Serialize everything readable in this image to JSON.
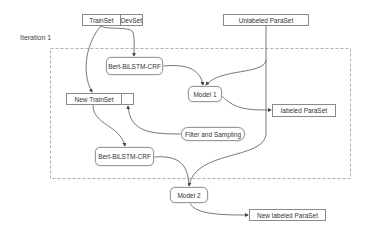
{
  "diagram": {
    "iteration_label": "Iteration 1",
    "nodes": {
      "trainset": "TrainSet",
      "devset": "DevSet",
      "unlabeled_paraset": "Unlabeled ParaSet",
      "bert_top": "Bert-BiLSTM-CRF",
      "model1": "Model 1",
      "labeled_paraset": "labeled ParaSet",
      "new_trainset": "New TrainSet",
      "new_trainset_extra": "",
      "filter_sampling": "Filter and Sampling",
      "bert_bottom": "Bert-BiLSTM-CRF",
      "model2": "Model 2",
      "new_labeled_paraset": "New labeled ParaSet"
    },
    "edges": [
      {
        "from": "TrainSet",
        "to": "Bert-BiLSTM-CRF (top)"
      },
      {
        "from": "TrainSet",
        "to": "New TrainSet"
      },
      {
        "from": "Bert-BiLSTM-CRF (top)",
        "to": "Model 1"
      },
      {
        "from": "Unlabeled ParaSet",
        "to": "Model 1"
      },
      {
        "from": "Model 1",
        "to": "labeled ParaSet"
      },
      {
        "from": "Filter and Sampling",
        "to": "New TrainSet"
      },
      {
        "from": "New TrainSet",
        "to": "Bert-BiLSTM-CRF (bottom)"
      },
      {
        "from": "Bert-BiLSTM-CRF (bottom)",
        "to": "Model 2"
      },
      {
        "from": "Unlabeled ParaSet",
        "to": "Model 2"
      },
      {
        "from": "Model 2",
        "to": "New labeled ParaSet"
      }
    ],
    "colors": {
      "line": "#555555",
      "dashed_border": "#9a9a9a",
      "box_border": "#8a8a8a"
    }
  }
}
